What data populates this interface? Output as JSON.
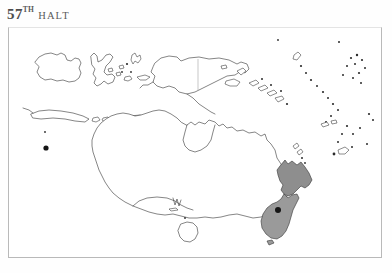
{
  "page": {
    "background_color": "#ffffff",
    "heading": {
      "number": "57",
      "ordinal_suffix": "TH",
      "word": "HALT"
    }
  },
  "map": {
    "frame": {
      "border_color": "#b9b9b9",
      "fill_color": "#ffffff"
    },
    "region_title": "Oceania",
    "coastline_color": "#3b3b3b",
    "highlight_color": "#8e8e8e",
    "marker_color": "#151515",
    "landmasses": [
      {
        "name": "Australia",
        "style": "outline",
        "label": ""
      },
      {
        "name": "Tasmania",
        "style": "outline",
        "label": ""
      },
      {
        "name": "New Guinea",
        "style": "outline",
        "label": ""
      },
      {
        "name": "Borneo",
        "style": "outline",
        "label": ""
      },
      {
        "name": "Sulawesi",
        "style": "outline",
        "label": ""
      },
      {
        "name": "Java",
        "style": "outline",
        "label": ""
      },
      {
        "name": "Lesser Sunda Islands",
        "style": "outline",
        "label": ""
      },
      {
        "name": "Solomon Islands",
        "style": "outline",
        "label": ""
      },
      {
        "name": "Vanuatu",
        "style": "outline",
        "label": ""
      },
      {
        "name": "New Caledonia",
        "style": "outline",
        "label": ""
      },
      {
        "name": "Fiji",
        "style": "outline",
        "label": ""
      },
      {
        "name": "Samoa",
        "style": "outline",
        "label": ""
      },
      {
        "name": "Tonga",
        "style": "outline",
        "label": ""
      },
      {
        "name": "New Zealand",
        "style": "shaded-highlight",
        "label": ""
      }
    ],
    "markers": [
      {
        "name": "west-coast-marker",
        "label": ""
      },
      {
        "name": "new-zealand-marker",
        "label": ""
      }
    ]
  }
}
